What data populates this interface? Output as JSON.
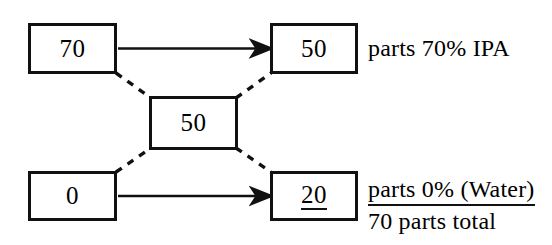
{
  "diagram": {
    "type": "pearson-square",
    "boxes": {
      "top_left": {
        "value": "70",
        "name": "high-concentration-input"
      },
      "top_right": {
        "value": "50",
        "name": "high-parts-output"
      },
      "middle": {
        "value": "50",
        "name": "target-concentration"
      },
      "bottom_left": {
        "value": "0",
        "name": "low-concentration-input"
      },
      "bottom_right": {
        "value": "20",
        "name": "low-parts-output",
        "underlined": true
      }
    },
    "labels": {
      "top_right_text": "parts 70% IPA",
      "bottom_right_text": "parts 0% (Water)",
      "total_text": "70 parts total"
    },
    "connectors": {
      "arrow_top": {
        "from": "top_left",
        "to": "top_right",
        "style": "solid-arrow"
      },
      "arrow_bottom": {
        "from": "bottom_left",
        "to": "bottom_right",
        "style": "solid-arrow"
      },
      "diagonal_top_left": {
        "from": "top_left",
        "to": "middle",
        "style": "dashed"
      },
      "diagonal_top_right": {
        "from": "middle",
        "to": "top_right",
        "style": "dashed"
      },
      "diagonal_bottom_left": {
        "from": "bottom_left",
        "to": "middle",
        "style": "dashed"
      },
      "diagonal_bottom_right": {
        "from": "middle",
        "to": "bottom_right",
        "style": "dashed"
      }
    },
    "colors": {
      "stroke": "#111111",
      "background": "#ffffff",
      "text": "#000000"
    }
  }
}
